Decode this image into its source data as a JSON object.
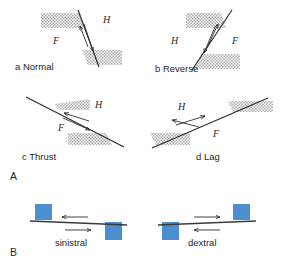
{
  "figure": {
    "type": "diagram",
    "background_color": "#ffffff",
    "line_color": "#2b2b2b",
    "block_fill_color": "#4c8fd0",
    "stipple_color": "#b9b9b9"
  },
  "panel_a": {
    "letter": "A",
    "description": "dip-slip fault block diagrams",
    "hanging_wall_label": "H",
    "footwall_label": "F",
    "items": [
      {
        "key": "normal",
        "letter": "a",
        "name": "Normal",
        "caption": "a   Normal",
        "hanging_label": "H",
        "foot_label": "F",
        "dip": "steep, down-to-the-right",
        "sense": "hanging wall down"
      },
      {
        "key": "reverse",
        "letter": "b",
        "name": "Reverse",
        "caption": "b   Reverse",
        "hanging_label": "H",
        "foot_label": "F",
        "dip": "steep, up-to-the-right",
        "sense": "hanging wall up"
      },
      {
        "key": "thrust",
        "letter": "c",
        "name": "Thrust",
        "caption": "c   Thrust",
        "hanging_label": "H",
        "foot_label": "F",
        "dip": "shallow, down-to-the-right",
        "sense": "hanging wall up along low angle"
      },
      {
        "key": "lag",
        "letter": "d",
        "name": "Lag",
        "caption": "d   Lag",
        "hanging_label": "H",
        "foot_label": "F",
        "dip": "shallow, up-to-the-right",
        "sense": "hanging wall down along low angle"
      }
    ]
  },
  "panel_b": {
    "letter": "B",
    "description": "strike-slip sense of movement map views",
    "items": [
      {
        "key": "sinistral",
        "label": "sinistral",
        "sense": "left-lateral",
        "far_block_arrow": "left",
        "near_block_arrow": "right"
      },
      {
        "key": "dextral",
        "label": "dextral",
        "sense": "right-lateral",
        "far_block_arrow": "right",
        "near_block_arrow": "left"
      }
    ]
  }
}
